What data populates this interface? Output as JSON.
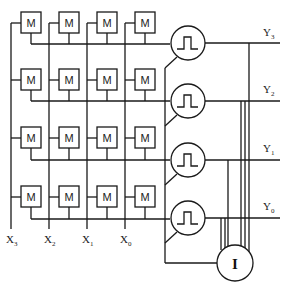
{
  "diagram": {
    "cell_label": "M",
    "pulse_icon": "pulse-icon",
    "integrator_label": "I",
    "inputs": [
      {
        "name": "X",
        "sub": "3"
      },
      {
        "name": "X",
        "sub": "2"
      },
      {
        "name": "X",
        "sub": "1"
      },
      {
        "name": "X",
        "sub": "0"
      }
    ],
    "outputs": [
      {
        "name": "Y",
        "sub": "3"
      },
      {
        "name": "Y",
        "sub": "2"
      },
      {
        "name": "Y",
        "sub": "1"
      },
      {
        "name": "Y",
        "sub": "0"
      }
    ],
    "colors": {
      "line": "#1a1a1a",
      "background": "#ffffff"
    }
  }
}
